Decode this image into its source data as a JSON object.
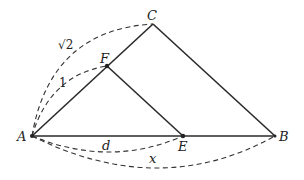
{
  "diagram": {
    "type": "geometry",
    "points": {
      "A": {
        "label": "A"
      },
      "B": {
        "label": "B"
      },
      "C": {
        "label": "C"
      },
      "E": {
        "label": "E"
      },
      "F": {
        "label": "F"
      }
    },
    "segments": [
      "AB",
      "AC",
      "BC",
      "FE"
    ],
    "dimension_labels": {
      "AC": "√2",
      "AF": "1",
      "AE": "d",
      "AB": "x"
    }
  }
}
